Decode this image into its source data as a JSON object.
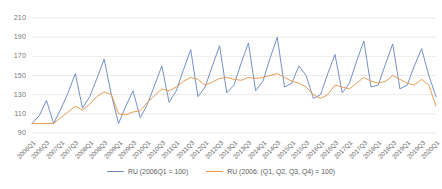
{
  "chart_data": {
    "type": "line",
    "title": "",
    "xlabel": "",
    "ylabel": "",
    "ylim": [
      90,
      215
    ],
    "yticks": [
      90,
      110,
      130,
      150,
      170,
      190,
      210
    ],
    "grid": true,
    "legend_position": "bottom-center",
    "x": [
      "2006Q1",
      "2006Q2",
      "2006Q3",
      "2006Q4",
      "2007Q1",
      "2007Q2",
      "2007Q3",
      "2007Q4",
      "2008Q1",
      "2008Q2",
      "2008Q3",
      "2008Q4",
      "2009Q1",
      "2009Q2",
      "2009Q3",
      "2009Q4",
      "2010Q1",
      "2010Q2",
      "2010Q3",
      "2010Q4",
      "2011Q1",
      "2011Q2",
      "2011Q3",
      "2011Q4",
      "2012Q1",
      "2012Q2",
      "2012Q3",
      "2012Q4",
      "2013Q1",
      "2013Q2",
      "2013Q3",
      "2013Q4",
      "2014Q1",
      "2014Q2",
      "2014Q3",
      "2014Q4",
      "2015Q1",
      "2015Q2",
      "2015Q3",
      "2015Q4",
      "2016Q1",
      "2016Q2",
      "2016Q3",
      "2016Q4",
      "2017Q1",
      "2017Q2",
      "2017Q3",
      "2017Q4",
      "2018Q1",
      "2018Q2",
      "2018Q3",
      "2018Q4",
      "2019Q1",
      "2019Q2",
      "2019Q3",
      "2019Q4",
      "2020Q1"
    ],
    "xticks": [
      "2006Q1",
      "2006Q3",
      "2007Q1",
      "2007Q3",
      "2008Q1",
      "2008Q3",
      "2009Q1",
      "2009Q3",
      "2010Q1",
      "2010Q3",
      "2011Q1",
      "2011Q3",
      "2012Q1",
      "2012Q3",
      "2013Q1",
      "2013Q3",
      "2014Q1",
      "2014Q3",
      "2015Q1",
      "2015Q3",
      "2016Q1",
      "2016Q3",
      "2017Q1",
      "2017Q3",
      "2018Q1",
      "2018Q3",
      "2019Q1",
      "2019Q3",
      "2020Q1"
    ],
    "series": [
      {
        "name": "RU (2006Q1 = 100)",
        "color": "#6b8ac4",
        "values": [
          100,
          108,
          124,
          100,
          115,
          132,
          152,
          116,
          128,
          147,
          167,
          130,
          100,
          118,
          134,
          106,
          120,
          140,
          160,
          122,
          134,
          156,
          177,
          128,
          138,
          160,
          181,
          132,
          140,
          163,
          184,
          134,
          144,
          168,
          190,
          138,
          142,
          160,
          150,
          126,
          130,
          152,
          172,
          132,
          142,
          165,
          186,
          138,
          140,
          162,
          183,
          136,
          140,
          160,
          178,
          150,
          128
        ]
      },
      {
        "name": "RU (2006: (Q1, Q2, Q3, Q4) = 100)",
        "color": "#e8974a",
        "values": [
          100,
          100,
          100,
          100,
          106,
          112,
          118,
          114,
          120,
          128,
          133,
          130,
          110,
          109,
          112,
          113,
          122,
          129,
          136,
          134,
          138,
          144,
          148,
          146,
          140,
          143,
          147,
          148,
          146,
          145,
          148,
          147,
          148,
          150,
          152,
          148,
          144,
          142,
          138,
          130,
          126,
          130,
          140,
          138,
          136,
          142,
          148,
          144,
          142,
          144,
          150,
          146,
          142,
          140,
          146,
          140,
          118
        ]
      }
    ]
  },
  "legend": {
    "items": [
      {
        "label": "RU (2006Q1 = 100)",
        "color": "#6b8ac4"
      },
      {
        "label": "RU (2006: (Q1, Q2, Q3, Q4) = 100)",
        "color": "#e8974a"
      }
    ]
  }
}
